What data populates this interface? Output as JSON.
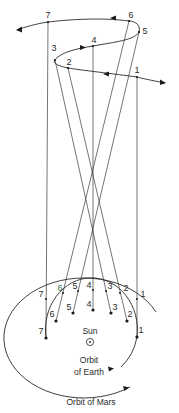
{
  "diagram": {
    "type": "retrograde-motion-of-mars",
    "labels": {
      "sun": "Sun",
      "earth_orbit_line1": "Orbit",
      "earth_orbit_line2": "of Earth",
      "mars_orbit": "Orbit of Mars"
    },
    "apparent_path_points": [
      {
        "id": "1",
        "label": "1"
      },
      {
        "id": "2",
        "label": "2"
      },
      {
        "id": "3",
        "label": "3"
      },
      {
        "id": "4",
        "label": "4"
      },
      {
        "id": "5",
        "label": "5"
      },
      {
        "id": "6",
        "label": "6"
      },
      {
        "id": "7",
        "label": "7"
      }
    ],
    "mars_positions": [
      {
        "id": "1",
        "label": "1"
      },
      {
        "id": "2",
        "label": "2"
      },
      {
        "id": "3",
        "label": "3"
      },
      {
        "id": "4",
        "label": "4"
      },
      {
        "id": "5",
        "label": "5"
      },
      {
        "id": "6",
        "label": "6"
      },
      {
        "id": "7",
        "label": "7"
      }
    ],
    "earth_positions": [
      {
        "id": "1",
        "label": "1"
      },
      {
        "id": "2",
        "label": "2"
      },
      {
        "id": "3",
        "label": "3"
      },
      {
        "id": "4",
        "label": "4"
      },
      {
        "id": "5",
        "label": "5"
      },
      {
        "id": "6",
        "label": "6"
      },
      {
        "id": "7",
        "label": "7"
      }
    ],
    "colors": {
      "ink": "#2a2a2a",
      "background": "#ffffff",
      "mars_label_6": "#2f6b4a"
    }
  }
}
